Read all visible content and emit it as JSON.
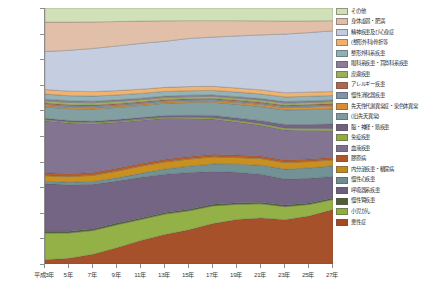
{
  "chart_data": {
    "type": "area",
    "stacked": true,
    "normalized": true,
    "title": "",
    "xlabel": "",
    "ylabel": "",
    "ylim": [
      0,
      100
    ],
    "ytick_labels": [
      "0%",
      "10%",
      "20%",
      "30%",
      "40%",
      "50%",
      "60%",
      "70%",
      "80%",
      "90%",
      "100%"
    ],
    "ytick_values": [
      0,
      10,
      20,
      30,
      40,
      50,
      60,
      70,
      80,
      90,
      100
    ],
    "grid": false,
    "legend_position": "right",
    "categories": [
      "平成3年",
      "5年",
      "7年",
      "9年",
      "11年",
      "13年",
      "15年",
      "17年",
      "19年",
      "21年",
      "23年",
      "25年",
      "27年"
    ],
    "x": [
      1,
      2,
      3,
      4,
      5,
      6,
      7,
      8,
      9,
      10,
      11,
      12,
      13
    ],
    "series_order_bottom_to_top": [
      "悪性症",
      "小児がん",
      "慢性腎疾患",
      "呼吸器系疾患",
      "慢性心疾患",
      "内分泌疾患・糖尿病",
      "膠原病",
      "血液疾患",
      "免疫疾患",
      "脳・神経・筋疾患",
      "(旧.先天異常)",
      "先天性代謝異常症・染色体異常",
      "慢性消化器疾患",
      "アレルギー疾患",
      "皮膚疾患",
      "眼科系疾患・耳鼻科系疾患",
      "整形外科系疾患",
      "(整形外科)骨折等",
      "精神疾患及び心身症",
      "身体虚弱・肥満",
      "その他"
    ],
    "series": [
      {
        "name": "悪性症",
        "color": "#a44a22",
        "values": [
          1.5,
          2.0,
          3.5,
          6.0,
          9.0,
          11.5,
          13.5,
          16.0,
          17.5,
          18.0,
          17.0,
          18.5,
          21.5
        ]
      },
      {
        "name": "小児がん",
        "color": "#8fae3e",
        "values": [
          9.5,
          9.0,
          8.5,
          8.5,
          8.0,
          8.0,
          7.5,
          7.0,
          6.0,
          5.5,
          5.0,
          4.5,
          4.0
        ]
      },
      {
        "name": "慢性腎疾患",
        "color": "#4e5e36",
        "values": [
          0.6,
          0.6,
          0.6,
          0.6,
          0.6,
          0.6,
          0.6,
          0.6,
          0.6,
          0.6,
          0.6,
          0.6,
          0.6
        ]
      },
      {
        "name": "呼吸器系疾患",
        "color": "#6d5f7e",
        "values": [
          17.0,
          16.5,
          16.0,
          15.5,
          15.5,
          15.0,
          14.5,
          13.0,
          12.0,
          11.0,
          10.0,
          9.5,
          8.5
        ]
      },
      {
        "name": "慢性心疾患",
        "color": "#6b8f92",
        "values": [
          0.8,
          0.9,
          1.0,
          1.2,
          1.5,
          2.0,
          2.5,
          3.0,
          3.2,
          3.5,
          3.8,
          4.0,
          4.2
        ]
      },
      {
        "name": "内分泌疾患・糖尿病",
        "color": "#c68b16",
        "values": [
          2.0,
          2.0,
          2.2,
          2.5,
          2.8,
          2.8,
          2.8,
          2.8,
          2.6,
          2.6,
          2.5,
          2.5,
          2.4
        ]
      },
      {
        "name": "膠原病",
        "color": "#b0572a",
        "values": [
          1.0,
          1.0,
          1.0,
          1.0,
          1.0,
          1.0,
          1.0,
          1.0,
          1.0,
          1.0,
          1.0,
          1.0,
          1.0
        ]
      },
      {
        "name": "血液疾患",
        "color": "#7e6f8e",
        "values": [
          18.5,
          18.0,
          17.5,
          17.0,
          16.5,
          16.0,
          15.0,
          14.0,
          13.0,
          12.0,
          11.5,
          11.0,
          10.5
        ]
      },
      {
        "name": "免疫疾患",
        "color": "#8fae3e",
        "values": [
          0.4,
          0.4,
          0.4,
          0.4,
          0.4,
          0.4,
          0.5,
          0.5,
          0.6,
          0.6,
          0.7,
          0.7,
          0.8
        ]
      },
      {
        "name": "脳・神経・筋疾患",
        "color": "#6f5f80",
        "values": [
          0.5,
          0.5,
          0.5,
          0.6,
          0.6,
          0.7,
          0.8,
          0.9,
          1.0,
          1.2,
          1.4,
          1.6,
          1.8
        ]
      },
      {
        "name": "(旧.先天異常)",
        "color": "#7d9b9e",
        "values": [
          4.0,
          4.2,
          4.4,
          4.5,
          4.6,
          4.8,
          5.0,
          5.2,
          5.4,
          5.5,
          5.6,
          5.8,
          6.0
        ]
      },
      {
        "name": "先天性代謝異常症・染色体異常",
        "color": "#d88c33",
        "values": [
          0.5,
          0.5,
          0.5,
          0.5,
          0.5,
          0.5,
          0.6,
          0.6,
          0.7,
          0.8,
          0.9,
          1.0,
          1.2
        ]
      },
      {
        "name": "慢性消化器疾患",
        "color": "#7f93aa",
        "values": [
          0.5,
          0.5,
          0.5,
          0.5,
          0.5,
          0.5,
          0.5,
          0.5,
          0.5,
          0.5,
          0.5,
          0.5,
          0.5
        ]
      },
      {
        "name": "アレルギー疾患",
        "color": "#b4644a",
        "values": [
          0.4,
          0.4,
          0.4,
          0.4,
          0.4,
          0.4,
          0.4,
          0.4,
          0.4,
          0.4,
          0.4,
          0.4,
          0.4
        ]
      },
      {
        "name": "皮膚疾患",
        "color": "#9bb05c",
        "values": [
          0.8,
          0.8,
          0.8,
          0.8,
          0.8,
          0.8,
          0.8,
          0.8,
          0.8,
          0.8,
          0.8,
          0.8,
          0.8
        ]
      },
      {
        "name": "眼科系疾患・耳鼻科系疾患",
        "color": "#8a7e9b",
        "values": [
          0.6,
          0.6,
          0.6,
          0.6,
          0.6,
          0.6,
          0.6,
          0.6,
          0.6,
          0.6,
          0.6,
          0.6,
          0.6
        ]
      },
      {
        "name": "整形外科系疾患",
        "color": "#8fb0b5",
        "values": [
          1.8,
          1.8,
          1.8,
          1.8,
          1.8,
          1.8,
          1.8,
          1.8,
          1.8,
          1.8,
          1.8,
          1.8,
          1.8
        ]
      },
      {
        "name": "(整形外科)骨折等",
        "color": "#f0b16a",
        "values": [
          1.6,
          1.6,
          1.6,
          1.6,
          1.6,
          1.6,
          1.6,
          1.6,
          1.6,
          1.6,
          1.6,
          1.6,
          1.6
        ]
      },
      {
        "name": "精神疾患及び心身症",
        "color": "#c3cbdf",
        "values": [
          13.5,
          14.5,
          15.5,
          16.5,
          17.5,
          18.0,
          19.0,
          19.5,
          20.5,
          21.5,
          22.5,
          23.0,
          24.0
        ]
      },
      {
        "name": "身体虚弱・肥満",
        "color": "#e0bda6",
        "values": [
          10.5,
          10.0,
          9.5,
          9.0,
          8.5,
          8.0,
          7.0,
          6.5,
          6.0,
          5.5,
          5.0,
          4.5,
          4.0
        ]
      },
      {
        "name": "その他",
        "color": "#cfe0b4",
        "values": [
          5.0,
          5.0,
          5.0,
          5.0,
          5.0,
          5.0,
          5.0,
          5.0,
          5.0,
          5.0,
          5.0,
          5.0,
          5.0
        ]
      }
    ]
  },
  "legend": {
    "items": [
      {
        "label": "その他",
        "color": "#cfe0b4"
      },
      {
        "label": "身体虚弱・肥満",
        "color": "#e0bda6"
      },
      {
        "label": "精神疾患及び心身症",
        "color": "#c3cbdf"
      },
      {
        "label": "(整形外科)骨折等",
        "color": "#f0b16a"
      },
      {
        "label": "整形外科系疾患",
        "color": "#8fb0b5"
      },
      {
        "label": "眼科系疾患・耳鼻科系疾患",
        "color": "#8a7e9b"
      },
      {
        "label": "皮膚疾患",
        "color": "#9bb05c"
      },
      {
        "label": "アレルギー疾患",
        "color": "#b4644a"
      },
      {
        "label": "慢性消化器疾患",
        "color": "#7f93aa"
      },
      {
        "label": "先天性代謝異常症・染色体異常",
        "color": "#d88c33"
      },
      {
        "label": "(旧.先天異常)",
        "color": "#7d9b9e"
      },
      {
        "label": "脳・神経・筋疾患",
        "color": "#6f5f80"
      },
      {
        "label": "免疫疾患",
        "color": "#8fae3e"
      },
      {
        "label": "血液疾患",
        "color": "#7e6f8e"
      },
      {
        "label": "膠原病",
        "color": "#b0572a"
      },
      {
        "label": "内分泌疾患・糖尿病",
        "color": "#c68b16"
      },
      {
        "label": "慢性心疾患",
        "color": "#6b8f92"
      },
      {
        "label": "呼吸器系疾患",
        "color": "#6d5f7e"
      },
      {
        "label": "慢性腎疾患",
        "color": "#4e5e36"
      },
      {
        "label": "小児がん",
        "color": "#8fae3e"
      },
      {
        "label": "悪性症",
        "color": "#a44a22"
      }
    ]
  }
}
